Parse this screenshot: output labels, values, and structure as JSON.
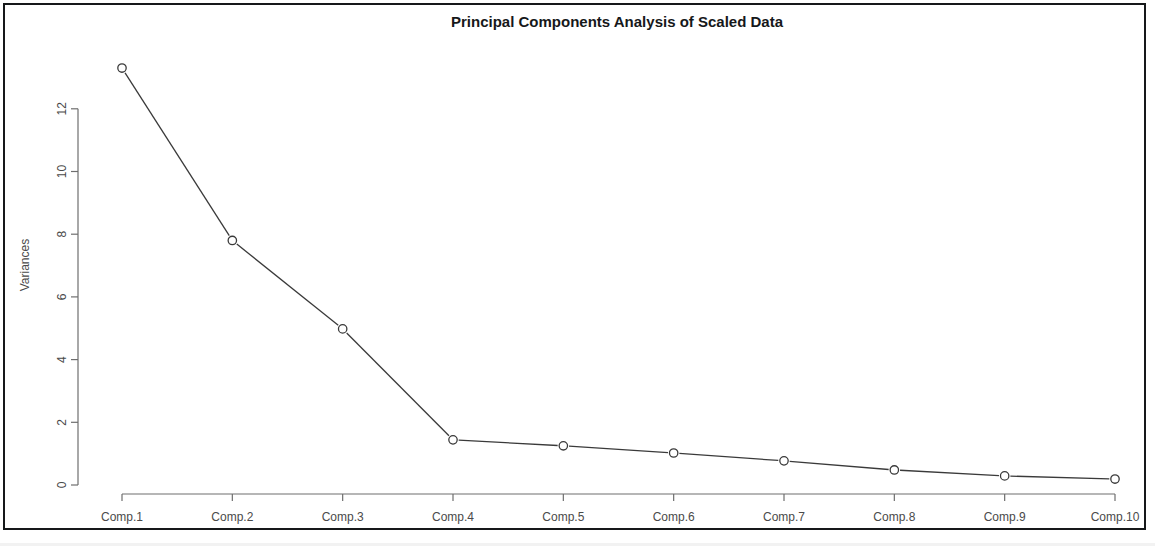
{
  "window": {
    "background_color": "#ffffff",
    "frame_color": "#16181a"
  },
  "chart_data": {
    "type": "line",
    "title": "Principal Components Analysis of Scaled Data",
    "xlabel": "",
    "ylabel": "Variances",
    "categories": [
      "Comp.1",
      "Comp.2",
      "Comp.3",
      "Comp.4",
      "Comp.5",
      "Comp.6",
      "Comp.7",
      "Comp.8",
      "Comp.9",
      "Comp.10"
    ],
    "values": [
      13.3,
      7.8,
      4.98,
      1.44,
      1.25,
      1.02,
      0.77,
      0.48,
      0.29,
      0.19
    ],
    "series": [
      {
        "name": "Variances",
        "values": [
          13.3,
          7.8,
          4.98,
          1.44,
          1.25,
          1.02,
          0.77,
          0.48,
          0.29,
          0.19
        ]
      }
    ],
    "y_ticks": [
      "0",
      "2",
      "4",
      "6",
      "8",
      "10",
      "12"
    ],
    "y_tick_values": [
      0,
      2,
      4,
      6,
      8,
      10,
      12
    ],
    "ylim": [
      0,
      12
    ],
    "grid": "off",
    "legend": "none",
    "marker": "open-circle",
    "line_color": "#3a3a3a",
    "point_color": "#3a3a3a",
    "axis_color": "#6e6e6e"
  }
}
